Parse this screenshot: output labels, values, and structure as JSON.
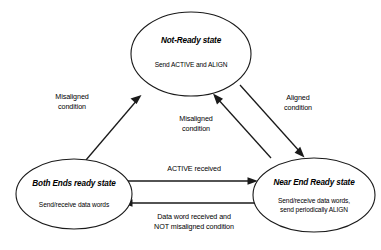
{
  "diagram": {
    "type": "state-transition-diagram",
    "background_color": "#ffffff",
    "stroke_color": "#1a1a1a",
    "states": [
      {
        "id": "not-ready",
        "title": "Not-Ready state",
        "body_lines": [
          "Send ACTIVE and ALIGN"
        ],
        "cx": 191,
        "cy": 54,
        "rx": 60,
        "ry": 42
      },
      {
        "id": "both-ends-ready",
        "title": "Both Ends ready state",
        "body_lines": [
          "Send/receive data words"
        ],
        "cx": 74,
        "cy": 194,
        "rx": 58,
        "ry": 35
      },
      {
        "id": "near-end-ready",
        "title": "Near End Ready state",
        "body_lines": [
          "Send/receive data words,",
          "send periodically ALIGN"
        ],
        "cx": 314,
        "cy": 195,
        "rx": 61,
        "ry": 37
      }
    ],
    "transitions": [
      {
        "id": "both-to-notready",
        "from": "both-ends-ready",
        "to": "not-ready",
        "label_lines": [
          "Misaligned",
          "condition"
        ],
        "label_x": 72,
        "label_y": 99
      },
      {
        "id": "notready-to-nearend",
        "from": "not-ready",
        "to": "near-end-ready",
        "label_lines": [
          "Aligned",
          "condition"
        ],
        "label_x": 298,
        "label_y": 100
      },
      {
        "id": "nearend-to-notready",
        "from": "near-end-ready",
        "to": "not-ready",
        "label_lines": [
          "Misaligned",
          "condition"
        ],
        "label_x": 196,
        "label_y": 121
      },
      {
        "id": "both-to-nearend",
        "from": "both-ends-ready",
        "to": "near-end-ready",
        "label_lines": [
          "ACTIVE received"
        ],
        "label_x": 194,
        "label_y": 171
      },
      {
        "id": "nearend-to-both",
        "from": "near-end-ready",
        "to": "both-ends-ready",
        "label_lines": [
          "Data word received and",
          "NOT misaligned condition"
        ],
        "label_x": 194,
        "label_y": 219
      }
    ]
  }
}
